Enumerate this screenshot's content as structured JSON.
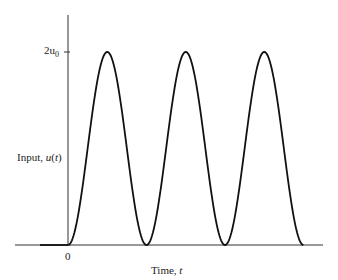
{
  "chart_data": {
    "type": "line",
    "title": "",
    "xlabel": "Time, t",
    "ylabel": "Input, u(t)",
    "x_tick_labels": [
      "0"
    ],
    "y_tick_labels": [
      "2u0"
    ],
    "series": [
      {
        "name": "u(t)",
        "x": [
          -1,
          0,
          0.5,
          1,
          1.5,
          2,
          2.5,
          3
        ],
        "values": [
          0,
          0,
          2,
          0,
          2,
          0,
          2,
          0
        ]
      }
    ],
    "ylim": [
      0,
      2
    ],
    "grid": false,
    "legend": "none"
  },
  "labels": {
    "y_tick": "2u",
    "y_tick_sub": "0",
    "y_axis_prefix": "Input, ",
    "y_axis_var": "u",
    "y_axis_suffix": "(",
    "y_axis_t": "t",
    "y_axis_close": ")",
    "x_zero": "0",
    "x_axis_prefix": "Time, ",
    "x_axis_var": "t"
  }
}
